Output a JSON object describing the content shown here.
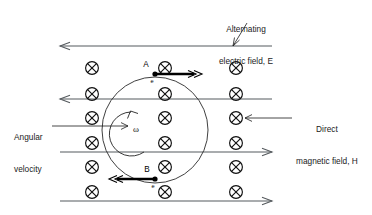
{
  "diagram": {
    "labels": {
      "alternating_field_line1": "Alternating",
      "alternating_field_line2": "electric field, E",
      "magnetic_field_line1": "Direct",
      "magnetic_field_line2": "magnetic field, H",
      "angular_velocity_line1": "Angular",
      "angular_velocity_line2": "velocity",
      "point_a": "A",
      "point_b": "B",
      "electron_a": "e",
      "electron_b": "e",
      "omega": "ω"
    },
    "colors": {
      "field_line": "#555a5e",
      "symbol": "#111111",
      "velocity_arrow": "#000000",
      "orbit": "#2a2a2a",
      "background": "#ffffff",
      "text": "#1a1a1a"
    },
    "field_lines": [
      {
        "name": "efield-line-1",
        "y": 46,
        "x1": 60,
        "x2": 272,
        "direction": "left"
      },
      {
        "name": "efield-line-2",
        "y": 99,
        "x1": 60,
        "x2": 272,
        "direction": "left"
      },
      {
        "name": "efield-line-3",
        "y": 152,
        "x1": 60,
        "x2": 272,
        "direction": "right"
      },
      {
        "name": "efield-line-4",
        "y": 201,
        "x1": 60,
        "x2": 272,
        "direction": "right"
      }
    ],
    "magnetic_symbol": "⊗",
    "magnetic_symbol_name": "field-into-page-cross",
    "cross_columns_x": [
      92,
      165,
      236
    ],
    "cross_rows_y": [
      68,
      94,
      118,
      143,
      167,
      192
    ],
    "orbit": {
      "cx": 155,
      "cy": 130,
      "r": 53
    },
    "particles": [
      {
        "name": "particle-a",
        "x": 155,
        "y": 74,
        "label": "A",
        "charge_label": "e",
        "velocity_direction": "right"
      },
      {
        "name": "particle-b",
        "x": 155,
        "y": 179,
        "label": "B",
        "charge_label": "e",
        "velocity_direction": "left"
      }
    ]
  }
}
